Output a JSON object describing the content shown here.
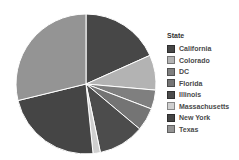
{
  "chart_data": {
    "type": "pie",
    "title": "",
    "legend_title": "State",
    "legend_position": "right",
    "direction": "clockwise",
    "start_angle_deg": 0,
    "slice_border_color": "#ffffff",
    "categories": [
      "California",
      "Colorado",
      "DC",
      "Florida",
      "Illinois",
      "Massachusetts",
      "New York",
      "Texas"
    ],
    "values": [
      18.3,
      8.1,
      4.4,
      5.3,
      10.6,
      1.7,
      22.8,
      28.8
    ],
    "unit": "percent-of-whole",
    "colors": [
      "#474747",
      "#b3b3b3",
      "#7f7f7f",
      "#747474",
      "#4c4c4c",
      "#cfcfcf",
      "#454545",
      "#949494"
    ]
  },
  "legend": {
    "title": "State"
  }
}
